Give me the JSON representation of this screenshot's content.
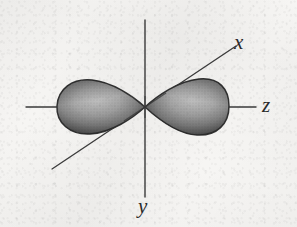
{
  "figure": {
    "kind": "atomic-orbital-diagram",
    "caption": "",
    "background_color": "#f6f5f3",
    "ink_color": "#303030"
  },
  "axes": {
    "x": {
      "label": "x",
      "orientation": "diagonal",
      "start": [
        52,
        169
      ],
      "end": [
        236,
        46
      ],
      "label_position": [
        234,
        32
      ]
    },
    "y": {
      "label": "y",
      "orientation": "vertical",
      "start": [
        145,
        20
      ],
      "end": [
        145,
        197
      ],
      "label_position": [
        138,
        196
      ]
    },
    "z": {
      "label": "z",
      "orientation": "horizontal",
      "start": [
        26,
        107
      ],
      "end": [
        256,
        107
      ],
      "label_position": [
        262,
        95
      ]
    },
    "origin": [
      145,
      107
    ],
    "line_color": "#3a3a3a",
    "line_width": 1.3
  },
  "orbital": {
    "name": "p-orbital",
    "aligned_axis": "z",
    "lobe_count": 2,
    "fill_light": "#b9b9b9",
    "fill_mid": "#8e8e8e",
    "fill_dark": "#4a4a4a",
    "outline_color": "#343434",
    "lobes": [
      {
        "side": "negative-z",
        "tip": [
          145,
          107
        ],
        "outer_extent": [
          57,
          107
        ],
        "half_width": 27,
        "widest_at": [
          80,
          107
        ]
      },
      {
        "side": "positive-z",
        "tip": [
          145,
          107
        ],
        "outer_extent": [
          229,
          107
        ],
        "half_width": 27,
        "widest_at": [
          204,
          107
        ]
      }
    ]
  },
  "labels": {
    "x": "x",
    "y": "y",
    "z": "z"
  }
}
